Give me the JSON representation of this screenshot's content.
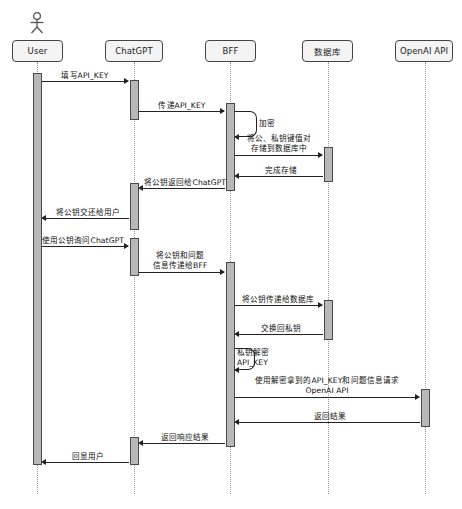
{
  "diagram": {
    "type": "uml-sequence-diagram",
    "title_caption": "",
    "canvas": {
      "width": 462,
      "height": 509
    },
    "background_color": "#ffffff",
    "participant_fill": "#f4f4f4",
    "participant_stroke": "#444444",
    "activation_fill": "#b8b8b8",
    "activation_stroke": "#4a4a4a",
    "lifeline_color": "#9a9a9a",
    "message_color": "#222222",
    "participants": [
      {
        "id": "user",
        "label": "User",
        "x": 37,
        "has_actor_icon": true
      },
      {
        "id": "chatgpt",
        "label": "ChatGPT",
        "x": 134,
        "has_actor_icon": false
      },
      {
        "id": "bff",
        "label": "BFF",
        "x": 230,
        "has_actor_icon": false
      },
      {
        "id": "db",
        "label": "数据库",
        "x": 328,
        "has_actor_icon": false
      },
      {
        "id": "openai",
        "label": "OpenAI API",
        "x": 425,
        "has_actor_icon": false
      }
    ],
    "messages": [
      {
        "index": 1,
        "from": "user",
        "to": "chatgpt",
        "label": "填写API_KEY",
        "direction": "right",
        "style": "solid"
      },
      {
        "index": 2,
        "from": "chatgpt",
        "to": "bff",
        "label": "传递API_KEY",
        "direction": "right",
        "style": "solid"
      },
      {
        "index": 3,
        "from": "bff",
        "to": "bff",
        "label": "加密",
        "direction": "self",
        "style": "solid"
      },
      {
        "index": 4,
        "from": "bff",
        "to": "db",
        "label": "将公、私钥键值对\n存储到数据库中",
        "direction": "right",
        "style": "solid"
      },
      {
        "index": 5,
        "from": "db",
        "to": "bff",
        "label": "完成存储",
        "direction": "left",
        "style": "solid"
      },
      {
        "index": 6,
        "from": "bff",
        "to": "chatgpt",
        "label": "将公钥返回给ChatGPT",
        "direction": "left",
        "style": "solid"
      },
      {
        "index": 7,
        "from": "chatgpt",
        "to": "user",
        "label": "将公钥交还给用户",
        "direction": "left",
        "style": "solid"
      },
      {
        "index": 8,
        "from": "user",
        "to": "chatgpt",
        "label": "使用公钥询问ChatGPT",
        "direction": "right",
        "style": "solid"
      },
      {
        "index": 9,
        "from": "chatgpt",
        "to": "bff",
        "label": "将公钥和问题\n信息传递给BFF",
        "direction": "right",
        "style": "solid"
      },
      {
        "index": 10,
        "from": "bff",
        "to": "db",
        "label": "将公钥传递给数据库",
        "direction": "right",
        "style": "solid"
      },
      {
        "index": 11,
        "from": "db",
        "to": "bff",
        "label": "交换回私钥",
        "direction": "left",
        "style": "solid"
      },
      {
        "index": 12,
        "from": "bff",
        "to": "bff",
        "label": "私钥解密\nAPI_KEY",
        "direction": "self",
        "style": "solid"
      },
      {
        "index": 13,
        "from": "bff",
        "to": "openai",
        "label": "使用解密拿到的API_KEY和问题信息请求\nOpenAI API",
        "direction": "right",
        "style": "solid"
      },
      {
        "index": 14,
        "from": "openai",
        "to": "bff",
        "label": "返回结果",
        "direction": "left",
        "style": "solid"
      },
      {
        "index": 15,
        "from": "bff",
        "to": "chatgpt",
        "label": "返回响应结果",
        "direction": "left",
        "style": "solid"
      },
      {
        "index": 16,
        "from": "chatgpt",
        "to": "user",
        "label": "回显用户",
        "direction": "left",
        "style": "solid"
      }
    ],
    "labels": {
      "m1": "填写API_KEY",
      "m2": "传递API_KEY",
      "m3": "加密",
      "m4_line1": "将公、私钥键值对",
      "m4_line2": "存储到数据库中",
      "m5": "完成存储",
      "m6": "将公钥返回给ChatGPT",
      "m7": "将公钥交还给用户",
      "m8": "使用公钥询问ChatGPT",
      "m9_line1": "将公钥和问题",
      "m9_line2": "信息传递给BFF",
      "m10": "将公钥传递给数据库",
      "m11": "交换回私钥",
      "m12_line1": "私钥解密",
      "m12_line2": "API_KEY",
      "m13_line1": "使用解密拿到的API_KEY和问题信息请求",
      "m13_line2": "OpenAI API",
      "m14": "返回结果",
      "m15": "返回响应结果",
      "m16": "回显用户"
    },
    "participant_labels": {
      "user": "User",
      "chatgpt": "ChatGPT",
      "bff": "BFF",
      "db": "数据库",
      "openai": "OpenAI API"
    }
  }
}
